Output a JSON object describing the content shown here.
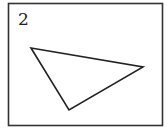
{
  "figure": {
    "label": "2",
    "frame": {
      "x": 8.5,
      "y": 3.5,
      "width": 154,
      "height": 122,
      "stroke": "#333333",
      "stroke_width": 1.6
    },
    "shape": {
      "type": "triangle",
      "points": "31,48 143,67 69,110",
      "stroke": "#222222",
      "stroke_width": 1.6,
      "fill": "none"
    }
  }
}
